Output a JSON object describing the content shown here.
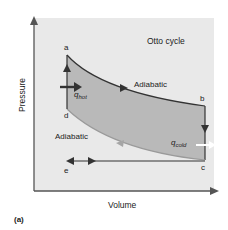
{
  "title": "Otto cycle",
  "axes": {
    "x_label": "Volume",
    "y_label": "Pressure"
  },
  "points": {
    "a": "a",
    "b": "b",
    "c": "c",
    "d": "d",
    "e": "e"
  },
  "process_labels": {
    "upper": "Adiabatic",
    "lower": "Adiabatic"
  },
  "heat": {
    "hot_main": "q",
    "hot_sub": "hot",
    "cold_main": "q",
    "cold_sub": "cold"
  },
  "panel_label": "(a)",
  "colors": {
    "background_panel": "#e9e9e9",
    "cycle_fill": "#b9b9b9",
    "line": "#333333",
    "cold_arrow": "#ffffff"
  }
}
